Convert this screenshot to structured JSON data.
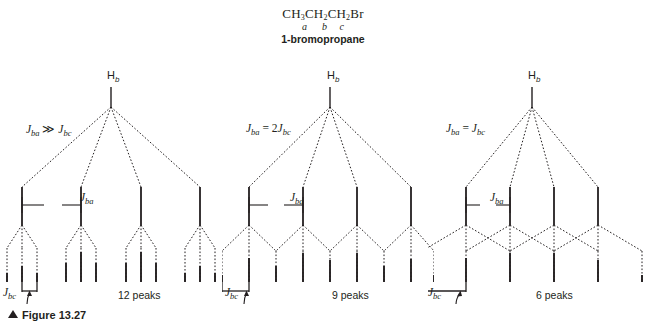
{
  "figure": {
    "molecule_formula": "CH3CH2CH2Br",
    "molecule_formula_parts": [
      {
        "t": "CH",
        "sub": "3"
      },
      {
        "t": "CH",
        "sub": "2"
      },
      {
        "t": "CH",
        "sub": "2"
      },
      {
        "t": "Br",
        "sub": ""
      }
    ],
    "locants": "a      b     c",
    "compound_name": "1-bromopropane",
    "caption": "Figure 13.27",
    "caption_marker": "▲",
    "ink_color": "#231f20"
  },
  "trees": [
    {
      "id": "tree-1",
      "proton_label": "H",
      "proton_subscript": "b",
      "coupling_condition": "J_ba >> J_bc",
      "coupling_condition_parts": {
        "j1": "J",
        "sub1": "ba",
        "relation": "≫",
        "j2": "J",
        "sub2": "bc"
      },
      "jba_label": "J",
      "jba_subscript": "ba",
      "jbc_label": "J",
      "jbc_subscript": "bc",
      "peak_count_text": "12 peaks",
      "peaks": 12,
      "quartet_intensities": [
        1,
        3,
        3,
        1
      ],
      "triplet_intensities": [
        1,
        2,
        1
      ],
      "final_intensities": [
        1,
        2,
        1,
        3,
        6,
        3,
        3,
        6,
        3,
        1,
        2,
        1
      ]
    },
    {
      "id": "tree-2",
      "proton_label": "H",
      "proton_subscript": "b",
      "coupling_condition": "J_ba = 2J_bc",
      "coupling_condition_parts": {
        "j1": "J",
        "sub1": "ba",
        "relation": "=",
        "factor": "2",
        "j2": "J",
        "sub2": "bc"
      },
      "jba_label": "J",
      "jba_subscript": "ba",
      "jbc_label": "J",
      "jbc_subscript": "bc",
      "peak_count_text": "9 peaks",
      "peaks": 9,
      "quartet_intensities": [
        1,
        3,
        3,
        1
      ],
      "triplet_intensities": [
        1,
        2,
        1
      ],
      "final_intensities": [
        1,
        2,
        1,
        3,
        6,
        3,
        3,
        6,
        3,
        1,
        2,
        1
      ]
    },
    {
      "id": "tree-3",
      "proton_label": "H",
      "proton_subscript": "b",
      "coupling_condition": "J_ba = J_bc",
      "coupling_condition_parts": {
        "j1": "J",
        "sub1": "ba",
        "relation": "=",
        "j2": "J",
        "sub2": "bc"
      },
      "jba_label": "J",
      "jba_subscript": "ba",
      "jbc_label": "J",
      "jbc_subscript": "bc",
      "peak_count_text": "6 peaks",
      "peaks": 6,
      "quartet_intensities": [
        1,
        3,
        3,
        1
      ],
      "triplet_intensities": [
        1,
        2,
        1
      ],
      "final_intensities": [
        1,
        3,
        5,
        5,
        3,
        1
      ]
    }
  ]
}
